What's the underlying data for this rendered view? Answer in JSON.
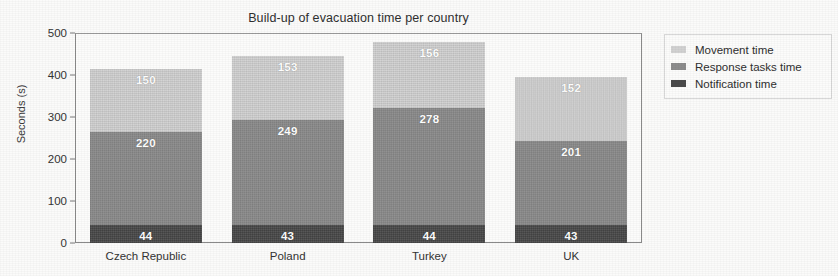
{
  "chart_data": {
    "type": "bar",
    "subtype": "stacked-bar",
    "title": "Build-up of evacuation time per country",
    "xlabel": "",
    "ylabel": "Seconds (s)",
    "categories": [
      "Czech Republic",
      "Poland",
      "Turkey",
      "UK"
    ],
    "ylim": [
      0,
      500
    ],
    "yticks": [
      0,
      100,
      200,
      300,
      400,
      500
    ],
    "ytick_labels": [
      "0",
      "100",
      "200",
      "300",
      "400",
      "500"
    ],
    "grid": false,
    "legend_position": "right",
    "stack_order_bottom_to_top": [
      "Notification time",
      "Response tasks time",
      "Movement time"
    ],
    "series": [
      {
        "name": "Notification time",
        "color": "#4a4a4a",
        "values": [
          44,
          43,
          44,
          43
        ]
      },
      {
        "name": "Response tasks time",
        "color": "#8d8d8d",
        "values": [
          220,
          249,
          278,
          201
        ]
      },
      {
        "name": "Movement time",
        "color": "#d2d2d2",
        "values": [
          150,
          153,
          156,
          152
        ]
      }
    ],
    "totals": [
      414,
      445,
      478,
      396
    ],
    "data_labels": {
      "Czech Republic": {
        "Notification time": "44",
        "Response tasks time": "220",
        "Movement time": "150"
      },
      "Poland": {
        "Notification time": "43",
        "Response tasks time": "249",
        "Movement time": "153"
      },
      "Turkey": {
        "Notification time": "44",
        "Response tasks time": "278",
        "Movement time": "156"
      },
      "UK": {
        "Notification time": "43",
        "Response tasks time": "201",
        "Movement time": "152"
      }
    }
  },
  "legend": {
    "items": [
      {
        "label": "Movement time",
        "color": "#d2d2d2"
      },
      {
        "label": "Response tasks time",
        "color": "#8d8d8d"
      },
      {
        "label": "Notification time",
        "color": "#4a4a4a"
      }
    ]
  }
}
